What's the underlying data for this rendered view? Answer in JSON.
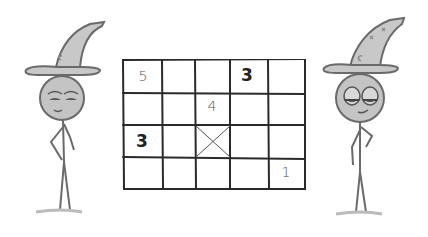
{
  "scene": {
    "description": "Two cartoon wizards standing beside a hand-drawn 5x4 grid puzzle",
    "colors": {
      "background": "#ffffff",
      "line": "#2a2a2a",
      "wizard_fill": "#bfbfbf",
      "wizard_stroke": "#6a6a6a"
    }
  },
  "grid": {
    "columns": 5,
    "rows": 4,
    "cells": [
      {
        "row": 0,
        "col": 0,
        "value": "5",
        "style": "handwritten"
      },
      {
        "row": 0,
        "col": 3,
        "value": "3",
        "style": "bold"
      },
      {
        "row": 1,
        "col": 2,
        "value": "4",
        "style": "handwritten"
      },
      {
        "row": 2,
        "col": 0,
        "value": "3",
        "style": "bold"
      },
      {
        "row": 2,
        "col": 2,
        "value": "",
        "style": "crossed"
      },
      {
        "row": 3,
        "col": 4,
        "value": "1",
        "style": "handwritten"
      }
    ]
  },
  "wizards": [
    {
      "position": "left",
      "expression": "smug",
      "pose": "hand-on-chin"
    },
    {
      "position": "right",
      "expression": "smirking",
      "pose": "hand-on-hip"
    }
  ]
}
